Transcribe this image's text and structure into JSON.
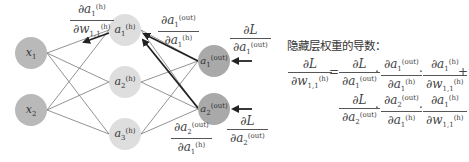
{
  "diagram": {
    "title": "隐藏层权重的导数：",
    "nodes": {
      "input": [
        {
          "id": "x1",
          "label": "x",
          "sub": "1",
          "cx": 31,
          "cy": 53
        },
        {
          "id": "x2",
          "label": "x",
          "sub": "2",
          "cx": 31,
          "cy": 110
        }
      ],
      "hidden": [
        {
          "id": "a1h",
          "label": "a",
          "sub": "1",
          "sup": "(h)",
          "cx": 125,
          "cy": 30
        },
        {
          "id": "a2h",
          "label": "a",
          "sub": "2",
          "sup": "(h)",
          "cx": 125,
          "cy": 82
        },
        {
          "id": "a3h",
          "label": "a",
          "sub": "3",
          "sup": "(h)",
          "cx": 125,
          "cy": 134
        }
      ],
      "output": [
        {
          "id": "a1out",
          "label": "a",
          "sub": "1",
          "sup": "(out)",
          "cx": 214,
          "cy": 61
        },
        {
          "id": "a2out",
          "label": "a",
          "sub": "2",
          "sup": "(out)",
          "cx": 214,
          "cy": 109
        }
      ]
    },
    "colors": {
      "input_node": "#b9b9b9",
      "hidden_node": "#dedede",
      "output_node": "#a9a9a9",
      "edge": "#666666",
      "arrow": "#222222"
    },
    "labels": {
      "da1h_dw11": {
        "num": "∂a",
        "num_sub": "1",
        "num_sup": "(h)",
        "den": "∂w",
        "den_sub": "1,1",
        "den_sup": "(h)"
      },
      "da1out_da1h": {
        "num": "∂a",
        "num_sub": "1",
        "num_sup": "(out)",
        "den": "∂a",
        "den_sub": "1",
        "den_sup": "(h)"
      },
      "da2out_da1h": {
        "num": "∂a",
        "num_sub": "2",
        "num_sup": "(out)",
        "den": "∂a",
        "den_sub": "1",
        "den_sup": "(h)"
      },
      "dL_da1out": {
        "num": "∂L",
        "den": "∂a",
        "den_sub": "1",
        "den_sup": "(out)"
      },
      "dL_da2out": {
        "num": "∂L",
        "den": "∂a",
        "den_sub": "2",
        "den_sup": "(out)"
      }
    },
    "equation": {
      "lhs": {
        "num": "∂L",
        "den": "∂w",
        "den_sub": "1,1",
        "den_sup": "(h)"
      },
      "equals": "=",
      "dot": "·",
      "plus": "+",
      "term1": [
        {
          "num": "∂L",
          "den": "∂a",
          "den_sub": "1",
          "den_sup": "(out)"
        },
        {
          "num": "∂a",
          "num_sub": "1",
          "num_sup": "(out)",
          "den": "∂a",
          "den_sub": "1",
          "den_sup": "(h)"
        },
        {
          "num": "∂a",
          "num_sub": "1",
          "num_sup": "(h)",
          "den": "∂w",
          "den_sub": "1,1",
          "den_sup": "(h)"
        }
      ],
      "term2": [
        {
          "num": "∂L",
          "den": "∂a",
          "den_sub": "2",
          "den_sup": "(out)"
        },
        {
          "num": "∂a",
          "num_sub": "2",
          "num_sup": "(out)",
          "den": "∂a",
          "den_sub": "1",
          "den_sup": "(h)"
        },
        {
          "num": "∂a",
          "num_sub": "1",
          "num_sup": "(h)",
          "den": "∂w",
          "den_sub": "1,1",
          "den_sup": "(h)"
        }
      ]
    }
  }
}
